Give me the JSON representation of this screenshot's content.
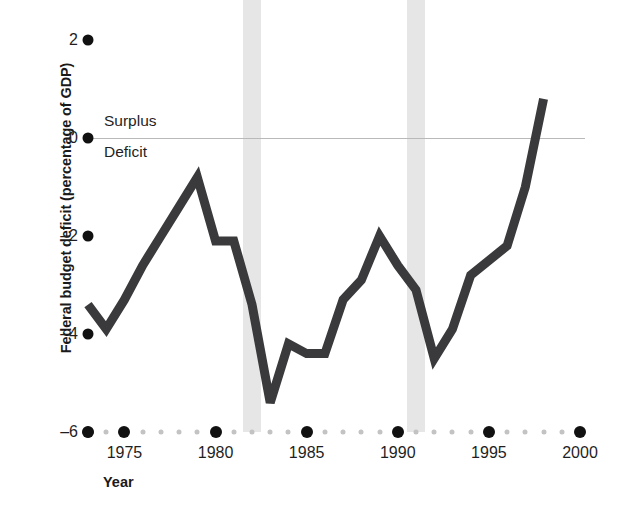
{
  "chart_data": {
    "type": "line",
    "title": "",
    "xlabel": "Year",
    "ylabel": "Federal budget deficit (percentage of GDP)",
    "xlim": [
      1973,
      2000
    ],
    "ylim": [
      -6,
      2.4
    ],
    "grid": false,
    "legend": "none",
    "zero_line": true,
    "annotations": [
      {
        "text": "Surplus",
        "position": "above-zero-line"
      },
      {
        "text": "Deficit",
        "position": "below-zero-line"
      }
    ],
    "y_ticks": [
      {
        "label": "2",
        "value": 2
      },
      {
        "label": "0",
        "value": 0
      },
      {
        "label": "–2",
        "value": -2
      },
      {
        "label": "–4",
        "value": -4
      },
      {
        "label": "–6",
        "value": -6
      }
    ],
    "x_ticks": [
      {
        "label": "1975",
        "value": 1975
      },
      {
        "label": "1980",
        "value": 1980
      },
      {
        "label": "1985",
        "value": 1985
      },
      {
        "label": "1990",
        "value": 1990
      },
      {
        "label": "1995",
        "value": 1995
      },
      {
        "label": "2000",
        "value": 2000
      }
    ],
    "x_major_tick_values": [
      1973,
      1975,
      1980,
      1985,
      1990,
      1995,
      2000
    ],
    "x_minor_tick_step": 1,
    "shaded_regions": [
      {
        "name": "recession-band-1",
        "start": 1981.5,
        "end": 1982.5,
        "color": "#e6e6e6"
      },
      {
        "name": "recession-band-2",
        "start": 1990.5,
        "end": 1991.5,
        "color": "#e6e6e6"
      }
    ],
    "series": [
      {
        "name": "Federal budget deficit",
        "color": "#3a3a3c",
        "x": [
          1973,
          1974,
          1975,
          1976,
          1977,
          1978,
          1979,
          1980,
          1981,
          1982,
          1983,
          1984,
          1985,
          1986,
          1987,
          1988,
          1989,
          1990,
          1991,
          1992,
          1993,
          1994,
          1995,
          1996,
          1997,
          1998
        ],
        "values": [
          -3.4,
          -3.9,
          -3.3,
          -2.6,
          -2.0,
          -1.4,
          -0.8,
          -2.1,
          -2.1,
          -3.4,
          -5.4,
          -4.2,
          -4.4,
          -4.4,
          -3.3,
          -2.9,
          -2.0,
          -2.6,
          -3.1,
          -4.5,
          -3.9,
          -2.8,
          -2.5,
          -2.2,
          -1.0,
          0.8
        ]
      }
    ]
  },
  "axis": {
    "y_title": "Federal budget deficit (percentage of GDP)",
    "x_title": "Year"
  },
  "labels": {
    "surplus": "Surplus",
    "deficit": "Deficit"
  },
  "colors": {
    "line": "#3a3a3c",
    "band": "#e6e6e6",
    "tick_major": "#111111",
    "tick_minor": "#c3c3c3",
    "zero_line": "#b9b9b9",
    "text": "#1f1f1f"
  }
}
